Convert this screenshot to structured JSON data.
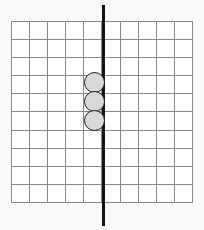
{
  "figure": {
    "background_color": "#f9f9f8",
    "width": 204,
    "height": 230
  },
  "grid": {
    "name": "square-grid",
    "columns": 10,
    "rows": 10,
    "cell_size": 18.1,
    "left": 11,
    "top": 21,
    "line_color": "#8a8a8a",
    "line_width": 1.4,
    "fill_color": "#ffffff"
  },
  "mirror_line": {
    "name": "vertical-symmetry-line",
    "orientation": "vertical",
    "x": 103.5,
    "top": 5,
    "bottom": 226,
    "thickness": 2.2,
    "color": "#141414",
    "grid_column_position": 5
  },
  "tokens": {
    "count": 3,
    "fill_color": "#d9d9d9",
    "outline_color": "#1d1d1d",
    "outline_width": 1.6,
    "diameter": 21,
    "items": [
      {
        "label": "counter-1",
        "grid_col": 5,
        "grid_row": 4,
        "left": 84,
        "top": 72
      },
      {
        "label": "counter-2",
        "grid_col": 5,
        "grid_row": 5,
        "left": 84,
        "top": 91
      },
      {
        "label": "counter-3",
        "grid_col": 5,
        "grid_row": 6,
        "left": 84,
        "top": 110
      }
    ]
  }
}
